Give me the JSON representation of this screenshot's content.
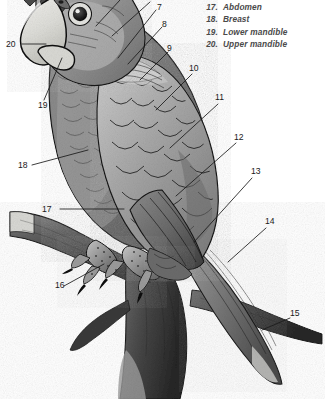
{
  "figure": {
    "background_color": "#ffffff",
    "ink_color": "#1a1a1a"
  },
  "legend": {
    "items": [
      {
        "num": "17.",
        "label": "Abdomen"
      },
      {
        "num": "18.",
        "label": "Breast"
      },
      {
        "num": "19.",
        "label": "Lower mandible"
      },
      {
        "num": "20.",
        "label": "Upper mandible"
      }
    ]
  },
  "callouts": [
    {
      "id": "7",
      "text": "7",
      "x": 157,
      "y": 3
    },
    {
      "id": "8",
      "text": "8",
      "x": 162,
      "y": 20
    },
    {
      "id": "9",
      "text": "9",
      "x": 167,
      "y": 44
    },
    {
      "id": "10",
      "text": "10",
      "x": 189,
      "y": 64
    },
    {
      "id": "11",
      "text": "11",
      "x": 215,
      "y": 93
    },
    {
      "id": "12",
      "text": "12",
      "x": 234,
      "y": 133
    },
    {
      "id": "13",
      "text": "13",
      "x": 251,
      "y": 167
    },
    {
      "id": "14",
      "text": "14",
      "x": 265,
      "y": 217
    },
    {
      "id": "15",
      "text": "15",
      "x": 290,
      "y": 309
    },
    {
      "id": "16",
      "text": "16",
      "x": 55,
      "y": 281
    },
    {
      "id": "17",
      "text": "17",
      "x": 42,
      "y": 205
    },
    {
      "id": "18",
      "text": "18",
      "x": 18,
      "y": 161
    },
    {
      "id": "19",
      "text": "19",
      "x": 38,
      "y": 101
    },
    {
      "id": "20",
      "text": "20",
      "x": 6,
      "y": 40
    }
  ]
}
